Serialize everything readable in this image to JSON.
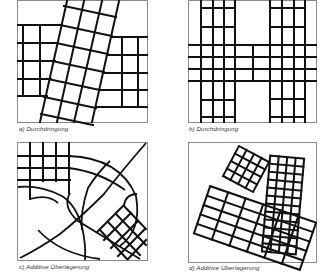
{
  "figure": {
    "panels": [
      {
        "id": "a",
        "caption": "a) Durchdringung",
        "description": "Two horizontal grid bands interrupted by a tilted rectangular grid strip crossing vertically"
      },
      {
        "id": "b",
        "caption": "b) Durchdringung",
        "description": "Two vertical grid columns penetrated by a horizontal grid band, forming an H shape"
      },
      {
        "id": "c",
        "caption": "c) Additive Überlagerung",
        "description": "Orthogonal grid in the top-left, curved radial street pattern, and a diagonal grid in the bottom-right"
      },
      {
        "id": "d",
        "caption": "d) Additive Überlagerung",
        "description": "Three rotated rectangular grids overlapping additively"
      }
    ],
    "colors": {
      "line": "#111111",
      "frame": "#8a8a8a",
      "background": "#ffffff",
      "caption": "#333333"
    }
  }
}
